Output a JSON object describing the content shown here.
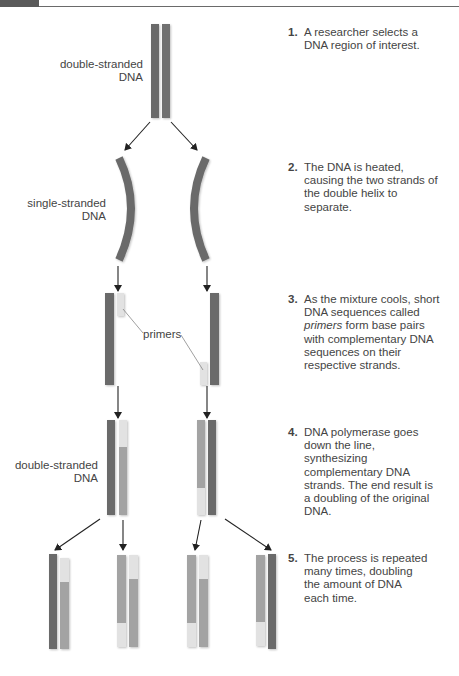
{
  "figure": {
    "colors": {
      "original_strand": "#6b6b6b",
      "new_strand": "#a3a3a3",
      "primer": "#e2e2e2",
      "arrow": "#222222",
      "text": "#444444"
    },
    "labels": {
      "top_double_stranded": [
        "double-stranded",
        "DNA"
      ],
      "single_stranded": [
        "single-stranded",
        "DNA"
      ],
      "primers": "primers",
      "bottom_double_stranded": [
        "double-stranded",
        "DNA"
      ]
    },
    "steps": [
      {
        "number": "1.",
        "text": "A researcher selects a DNA region of interest."
      },
      {
        "number": "2.",
        "text": "The DNA is heated, causing the two strands of the double helix to separate."
      },
      {
        "number": "3.",
        "text_before": "As the mixture cools, short DNA sequences called ",
        "text_italic": "primers",
        "text_after": " form base pairs with complementary DNA sequences on their respective strands."
      },
      {
        "number": "4.",
        "text": "DNA polymerase goes down the line, synthesizing complementary DNA strands. The end result is a doubling of the original DNA."
      },
      {
        "number": "5.",
        "text": "The process is repeated many times, doubling the amount of DNA each time."
      }
    ]
  }
}
